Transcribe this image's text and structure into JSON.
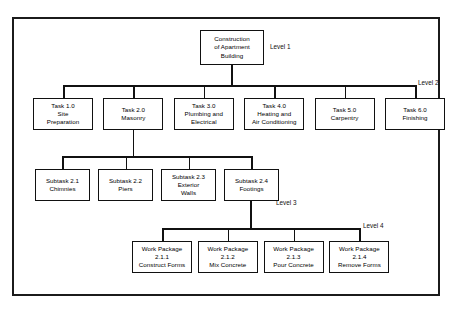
{
  "level_labels": {
    "level1": "Level 1",
    "level2": "Level 2",
    "level3": "Level 3",
    "level4": "Level 4"
  },
  "nodes": {
    "root": {
      "line1": "Construction",
      "line2": "of Apartment",
      "line3": "Building"
    },
    "level2": [
      {
        "line1": "Task 1.0",
        "line2": "Site",
        "line3": "Preparation"
      },
      {
        "line1": "Task 2.0",
        "line2": "Masonry",
        "line3": ""
      },
      {
        "line1": "Task 3.0",
        "line2": "Plumbing and",
        "line3": "Electrical"
      },
      {
        "line1": "Task 4.0",
        "line2": "Heating and",
        "line3": "Air Conditioning"
      },
      {
        "line1": "Task 5.0",
        "line2": "Carpentry",
        "line3": ""
      },
      {
        "line1": "Task 6.0",
        "line2": "Finishing",
        "line3": ""
      }
    ],
    "level3": [
      {
        "line1": "Subtask 2.1",
        "line2": "Chimnies",
        "line3": ""
      },
      {
        "line1": "Subtask 2.2",
        "line2": "Piers",
        "line3": ""
      },
      {
        "line1": "Subtask 2.3",
        "line2": "Exterior",
        "line3": "Walls"
      },
      {
        "line1": "Subtask 2.4",
        "line2": "Footings",
        "line3": ""
      }
    ],
    "level4": [
      {
        "line1": "Work Package",
        "line2": "2.1.1",
        "line3": "Construct Forms"
      },
      {
        "line1": "Work Package",
        "line2": "2.1.2",
        "line3": "Mix Concrete"
      },
      {
        "line1": "Work Package",
        "line2": "2.1.3",
        "line3": "Pour Concrete"
      },
      {
        "line1": "Work Package",
        "line2": "2.1.4",
        "line3": "Remove Forms"
      }
    ]
  },
  "colors": {
    "line": "#111111",
    "frame": "#1b1b1b",
    "background": "#ffffff"
  }
}
